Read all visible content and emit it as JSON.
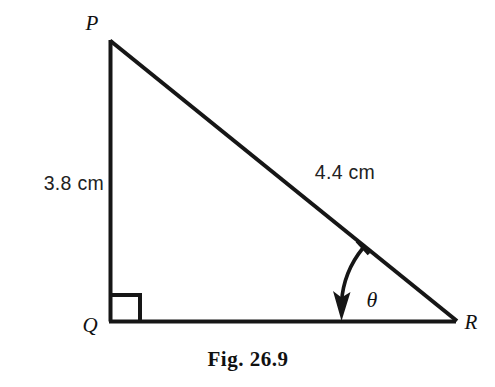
{
  "figure": {
    "caption": "Fig. 26.9",
    "background_color": "#ffffff",
    "line_color": "#161616",
    "vertices": {
      "p_label": "P",
      "q_label": "Q",
      "r_label": "R"
    },
    "angle": {
      "symbol": "θ",
      "marker": "arc-with-arrowhead",
      "at_vertex": "R"
    },
    "right_angle": {
      "marker": "square",
      "at_vertex": "Q"
    },
    "measurements": [
      {
        "name": "side-pq",
        "value": "3.8 cm",
        "side": "PQ",
        "position": "left"
      },
      {
        "name": "side-pr",
        "value": "4.4 cm",
        "side": "PR",
        "position": "above-hypotenuse"
      }
    ]
  },
  "geometry": {
    "p": {
      "x": 110,
      "y": 40
    },
    "q": {
      "x": 110,
      "y": 321
    },
    "r": {
      "x": 456,
      "y": 321
    }
  }
}
